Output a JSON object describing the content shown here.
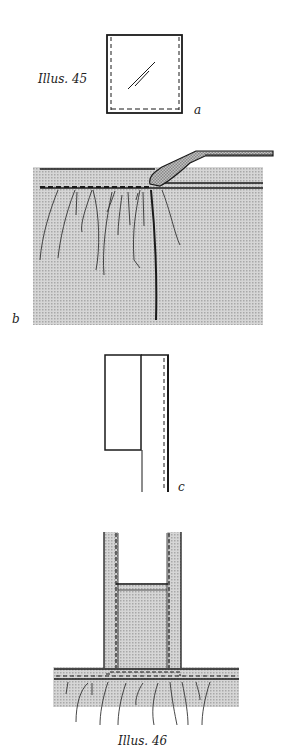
{
  "figures": [
    {
      "id": "illus-45",
      "caption": "Illus. 45",
      "panels": [
        {
          "letter": "a"
        },
        {
          "letter": "b"
        },
        {
          "letter": "c"
        }
      ]
    },
    {
      "id": "illus-46",
      "caption": "Illus. 46"
    }
  ],
  "labels": {
    "illus45": "Illus. 45",
    "a": "a",
    "b": "b",
    "c": "c",
    "illus46": "Illus. 46"
  },
  "colors": {
    "line": "#1a1a1a",
    "fabric_fill": "#c8c8c8",
    "background": "#ffffff"
  }
}
